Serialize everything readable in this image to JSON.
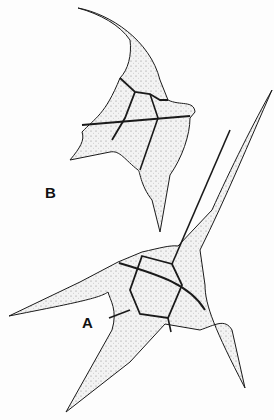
{
  "figure": {
    "labels": {
      "a": "A",
      "b": "B"
    },
    "specimens": [
      {
        "id": "A",
        "description": "dinoflagellate with three long horns, ventral view"
      },
      {
        "id": "B",
        "description": "dinoflagellate with curved apical horn, lateral view"
      }
    ],
    "colors": {
      "outline": "#1a1a1a",
      "fill": "#ececec",
      "background": "#fdfdfd"
    }
  }
}
